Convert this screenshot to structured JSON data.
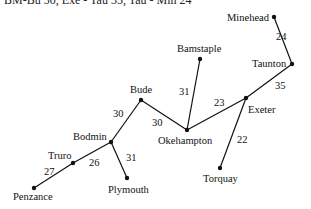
{
  "top_text": "BM-Bu 30, Exe - Tau 35, Tau - Min 24",
  "graph": {
    "nodes": [
      {
        "id": "minehead",
        "label": "Minehead",
        "x": 274,
        "y": 17,
        "lx": 227,
        "ly": 21
      },
      {
        "id": "taunton",
        "label": "Taunton",
        "x": 292,
        "y": 64,
        "lx": 252,
        "ly": 67
      },
      {
        "id": "bamstaple",
        "label": "Bamstaple",
        "x": 200,
        "y": 59,
        "lx": 177,
        "ly": 52
      },
      {
        "id": "exeter",
        "label": "Exeter",
        "x": 246,
        "y": 98,
        "lx": 248,
        "ly": 113
      },
      {
        "id": "bude",
        "label": "Bude",
        "x": 141,
        "y": 100,
        "lx": 130,
        "ly": 93
      },
      {
        "id": "okehampton",
        "label": "Okehampton",
        "x": 187,
        "y": 130,
        "lx": 158,
        "ly": 144
      },
      {
        "id": "torquay",
        "label": "Torquay",
        "x": 220,
        "y": 168,
        "lx": 203,
        "ly": 182
      },
      {
        "id": "bodmin",
        "label": "Bodmin",
        "x": 111,
        "y": 142,
        "lx": 73,
        "ly": 140
      },
      {
        "id": "truro",
        "label": "Truro",
        "x": 73,
        "y": 163,
        "lx": 48,
        "ly": 159
      },
      {
        "id": "plymouth",
        "label": "Plymouth",
        "x": 127,
        "y": 178,
        "lx": 108,
        "ly": 193
      },
      {
        "id": "penzance",
        "label": "Penzance",
        "x": 34,
        "y": 188,
        "lx": 13,
        "ly": 200
      }
    ],
    "edges": [
      {
        "from": "minehead",
        "to": "taunton",
        "weight": "24",
        "wx": 276,
        "wy": 40
      },
      {
        "from": "taunton",
        "to": "exeter",
        "weight": "35",
        "wx": 275,
        "wy": 89
      },
      {
        "from": "exeter",
        "to": "okehampton",
        "weight": "23",
        "wx": 214,
        "wy": 106
      },
      {
        "from": "bamstaple",
        "to": "okehampton",
        "weight": "31",
        "wx": 179,
        "wy": 95
      },
      {
        "from": "exeter",
        "to": "torquay",
        "weight": "22",
        "wx": 237,
        "wy": 143
      },
      {
        "from": "bude",
        "to": "okehampton",
        "weight": "30",
        "wx": 152,
        "wy": 126
      },
      {
        "from": "bodmin",
        "to": "bude",
        "weight": "30",
        "wx": 113,
        "wy": 117
      },
      {
        "from": "bodmin",
        "to": "plymouth",
        "weight": "31",
        "wx": 126,
        "wy": 161
      },
      {
        "from": "truro",
        "to": "bodmin",
        "weight": "26",
        "wx": 89,
        "wy": 166
      },
      {
        "from": "penzance",
        "to": "truro",
        "weight": "27",
        "wx": 44,
        "wy": 175
      }
    ]
  }
}
